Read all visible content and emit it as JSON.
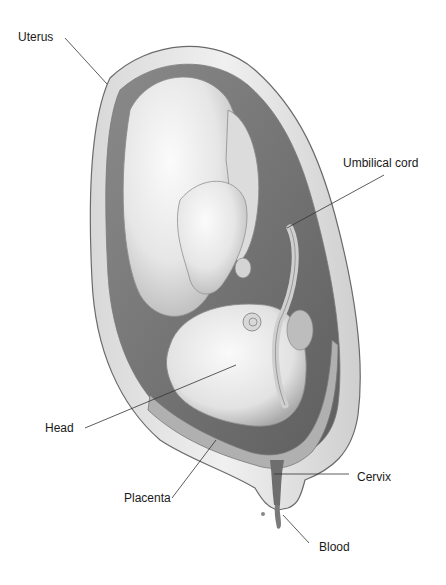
{
  "diagram": {
    "colors": {
      "label_text": "#1a1a1a",
      "leader_line": "#333333",
      "background": "#ffffff"
    },
    "labels": [
      {
        "id": "uterus",
        "text": "Uterus",
        "x": 18,
        "y": 30,
        "line": [
          65,
          38,
          107,
          84
        ]
      },
      {
        "id": "umbilical-cord",
        "text": "Umbilical cord",
        "x": 343,
        "y": 156,
        "line": [
          384,
          175,
          287,
          228
        ]
      },
      {
        "id": "head",
        "text": "Head",
        "x": 45,
        "y": 421,
        "line": [
          85,
          428,
          236,
          365
        ]
      },
      {
        "id": "placenta",
        "text": "Placenta",
        "x": 124,
        "y": 491,
        "line": [
          172,
          498,
          216,
          440
        ]
      },
      {
        "id": "cervix",
        "text": "Cervix",
        "x": 357,
        "y": 470,
        "line": [
          349,
          474,
          274,
          474
        ]
      },
      {
        "id": "blood",
        "text": "Blood",
        "x": 319,
        "y": 540,
        "line": [
          309,
          543,
          283,
          515
        ]
      }
    ]
  }
}
